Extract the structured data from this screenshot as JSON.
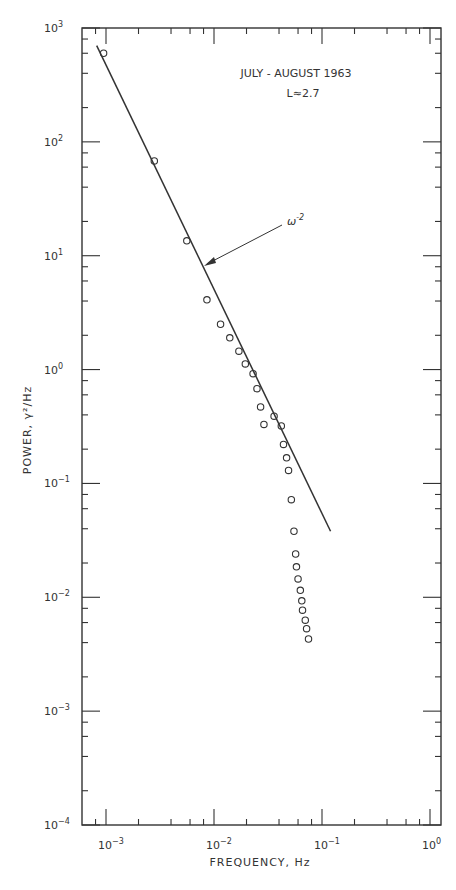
{
  "chart_data": {
    "type": "scatter",
    "title": "JULY - AUGUST 1963",
    "subtitle": "L≈2.7",
    "xlabel": "FREQUENCY, Hz",
    "ylabel": "POWER, γ²/Hz",
    "xscale": "log",
    "yscale": "log",
    "xlim": [
      0.0006,
      1.0
    ],
    "ylim": [
      0.0001,
      1000
    ],
    "x_ticks": [
      "10^-3",
      "10^-2",
      "10^-1",
      "10^0"
    ],
    "y_ticks": [
      "10^-4",
      "10^-3",
      "10^-2",
      "10^-1",
      "10^0",
      "10^1",
      "10^2",
      "10^3"
    ],
    "grid": false,
    "legend": null,
    "annotation": {
      "text": "ω^-2",
      "points_to": "fit line",
      "at": [
        0.0085,
        8.5
      ]
    },
    "series": [
      {
        "name": "observed power spectrum",
        "marker": "open circle",
        "points": [
          [
            0.00095,
            600
          ],
          [
            0.0028,
            68
          ],
          [
            0.0056,
            13.5
          ],
          [
            0.0086,
            4.1
          ],
          [
            0.0115,
            2.5
          ],
          [
            0.014,
            1.9
          ],
          [
            0.017,
            1.45
          ],
          [
            0.0195,
            1.12
          ],
          [
            0.023,
            0.92
          ],
          [
            0.025,
            0.68
          ],
          [
            0.027,
            0.47
          ],
          [
            0.029,
            0.33
          ],
          [
            0.036,
            0.39
          ],
          [
            0.042,
            0.32
          ],
          [
            0.044,
            0.22
          ],
          [
            0.047,
            0.168
          ],
          [
            0.049,
            0.13
          ],
          [
            0.052,
            0.072
          ],
          [
            0.055,
            0.038
          ],
          [
            0.057,
            0.024
          ],
          [
            0.058,
            0.0185
          ],
          [
            0.06,
            0.0145
          ],
          [
            0.063,
            0.0115
          ],
          [
            0.065,
            0.0093
          ],
          [
            0.066,
            0.0077
          ],
          [
            0.07,
            0.0063
          ],
          [
            0.072,
            0.0053
          ],
          [
            0.075,
            0.0043
          ]
        ]
      },
      {
        "name": "ω^-2 fit",
        "marker": "line",
        "points": [
          [
            0.00082,
            700
          ],
          [
            0.12,
            0.038
          ]
        ]
      }
    ]
  },
  "labels": {
    "title": "JULY - AUGUST  1963",
    "subtitle": "L≈2.7",
    "xlabel": "FREQUENCY, Hz",
    "ylabel": "POWER, γ²/Hz",
    "annotation": "ω",
    "annotation_exp": "-2"
  }
}
